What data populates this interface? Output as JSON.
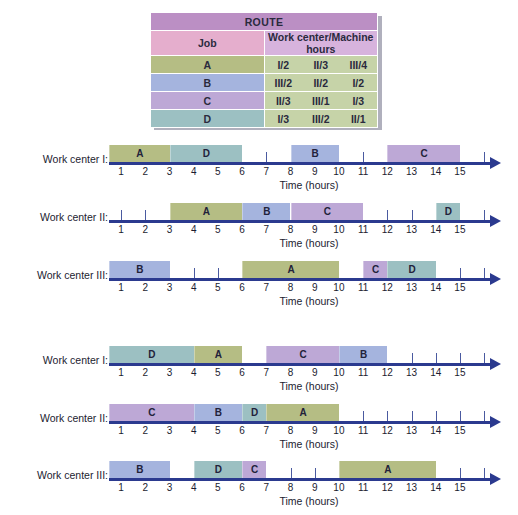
{
  "route_table": {
    "title": "ROUTE",
    "col_job": "Job",
    "col_route": "Work center/Machine hours",
    "rows": [
      {
        "job": "A",
        "steps": [
          "I/2",
          "II/3",
          "III/4"
        ]
      },
      {
        "job": "B",
        "steps": [
          "III/2",
          "II/2",
          "I/2"
        ]
      },
      {
        "job": "C",
        "steps": [
          "II/3",
          "III/1",
          "I/3"
        ]
      },
      {
        "job": "D",
        "steps": [
          "I/3",
          "III/2",
          "II/1"
        ]
      }
    ]
  },
  "axis": {
    "caption": "Time (hours)",
    "tick_labels": [
      "1",
      "2",
      "3",
      "4",
      "5",
      "6",
      "7",
      "8",
      "9",
      "10",
      "11",
      "12",
      "13",
      "14",
      "15"
    ],
    "min": 0,
    "max": 15.8
  },
  "job_colors": {
    "A": "#b5bd84",
    "B": "#a5b4de",
    "C": "#bda8d6",
    "D": "#9cc0c2"
  },
  "chart_data": {
    "type": "bar",
    "xlabel": "Time (hours)",
    "ylabel": "",
    "xlim": [
      0,
      15.8
    ],
    "grid": false,
    "legend": "none",
    "categories": [
      "Work center I",
      "Work center II",
      "Work center III"
    ],
    "schedules": [
      {
        "group": 1,
        "rows": [
          {
            "label": "Work center I:",
            "bars": [
              {
                "job": "A",
                "start": 0,
                "end": 2.5
              },
              {
                "job": "D",
                "start": 2.5,
                "end": 5.5
              },
              {
                "job": "B",
                "start": 7.5,
                "end": 9.5
              },
              {
                "job": "C",
                "start": 11.5,
                "end": 14.5
              }
            ],
            "ticks": [
              6.5,
              10.5,
              15.5
            ]
          },
          {
            "label": "Work center II:",
            "bars": [
              {
                "job": "A",
                "start": 2.5,
                "end": 5.5
              },
              {
                "job": "B",
                "start": 5.5,
                "end": 7.5
              },
              {
                "job": "C",
                "start": 7.5,
                "end": 10.5
              },
              {
                "job": "D",
                "start": 13.5,
                "end": 14.5
              }
            ],
            "ticks": [
              0.5,
              1.5,
              11.5,
              12.5,
              15.5
            ]
          },
          {
            "label": "Work center III:",
            "bars": [
              {
                "job": "B",
                "start": 0,
                "end": 2.5
              },
              {
                "job": "A",
                "start": 5.5,
                "end": 9.5
              },
              {
                "job": "C",
                "start": 10.5,
                "end": 11.5
              },
              {
                "job": "D",
                "start": 11.5,
                "end": 13.5
              }
            ],
            "ticks": [
              3.5,
              4.5,
              14.5,
              15.5
            ]
          }
        ]
      },
      {
        "group": 2,
        "rows": [
          {
            "label": "Work center I:",
            "bars": [
              {
                "job": "D",
                "start": 0,
                "end": 3.5
              },
              {
                "job": "A",
                "start": 3.5,
                "end": 5.5
              },
              {
                "job": "C",
                "start": 6.5,
                "end": 9.5
              },
              {
                "job": "B",
                "start": 9.5,
                "end": 11.5
              }
            ],
            "ticks": [
              12.5,
              13.5,
              14.5,
              15.5
            ]
          },
          {
            "label": "Work center II:",
            "bars": [
              {
                "job": "C",
                "start": 0,
                "end": 3.5
              },
              {
                "job": "B",
                "start": 3.5,
                "end": 5.5
              },
              {
                "job": "D",
                "start": 5.5,
                "end": 6.5
              },
              {
                "job": "A",
                "start": 6.5,
                "end": 9.5
              }
            ],
            "ticks": [
              10.5,
              11.5,
              12.5,
              13.5,
              14.5,
              15.5
            ]
          },
          {
            "label": "Work center III:",
            "bars": [
              {
                "job": "B",
                "start": 0,
                "end": 2.5
              },
              {
                "job": "D",
                "start": 3.5,
                "end": 5.5
              },
              {
                "job": "C",
                "start": 5.5,
                "end": 6.5
              },
              {
                "job": "A",
                "start": 9.5,
                "end": 13.5
              }
            ],
            "ticks": [
              7.5,
              8.5,
              14.5,
              15.5
            ]
          }
        ]
      }
    ]
  }
}
